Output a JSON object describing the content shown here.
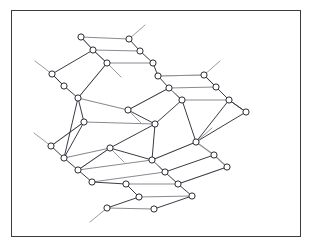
{
  "figure": {
    "title": "Hexagonal layered lattice perspective drawing",
    "kind": "line-drawing",
    "border_color": "#3a3a42",
    "background_color": "#ffffff",
    "node_fill": "#ffffff",
    "node_stroke": "#2b2b33",
    "bond_color_front": "#3b3b45",
    "bond_color_back": "#cfcfd4",
    "bond_color_mid": "#8a8a93",
    "stub_color": "#9a9aa3",
    "node_radius": 3.1,
    "node_count": 40,
    "ring_count": 3,
    "layer_count": 2
  },
  "chart_data": {
    "type": "scatter",
    "title": "Hexagonal layered lattice perspective drawing",
    "subtitle": "",
    "xlabel": "",
    "ylabel": "",
    "xlim": [
      11,
      301
    ],
    "ylim": [
      10,
      237
    ],
    "grid": false,
    "legend": "none",
    "axes_visible": false,
    "annotations": [],
    "layers": [
      {
        "name": "upper-layer",
        "stroke": "#3b3b45",
        "nodes": [
          {
            "id": "U1",
            "x": 81,
            "y": 37
          },
          {
            "id": "U2",
            "x": 129,
            "y": 39
          },
          {
            "id": "U3",
            "x": 93,
            "y": 50
          },
          {
            "id": "U4",
            "x": 140,
            "y": 51
          },
          {
            "id": "U5",
            "x": 107,
            "y": 63
          },
          {
            "id": "U6",
            "x": 153,
            "y": 63
          },
          {
            "id": "U7",
            "x": 52,
            "y": 74
          },
          {
            "id": "U8",
            "x": 64,
            "y": 86
          },
          {
            "id": "U9",
            "x": 158,
            "y": 76
          },
          {
            "id": "U10",
            "x": 204,
            "y": 75
          },
          {
            "id": "U11",
            "x": 78,
            "y": 98
          },
          {
            "id": "U12",
            "x": 169,
            "y": 88
          },
          {
            "id": "U13",
            "x": 216,
            "y": 87
          },
          {
            "id": "U14",
            "x": 128,
            "y": 110
          },
          {
            "id": "U15",
            "x": 182,
            "y": 100
          },
          {
            "id": "U16",
            "x": 229,
            "y": 100
          },
          {
            "id": "U17",
            "x": 84,
            "y": 122
          },
          {
            "id": "U18",
            "x": 155,
            "y": 124
          },
          {
            "id": "U19",
            "x": 246,
            "y": 112
          },
          {
            "id": "U20",
            "x": 51,
            "y": 146
          }
        ]
      },
      {
        "name": "lower-layer",
        "stroke": "#3b3b45",
        "nodes": [
          {
            "id": "L1",
            "x": 64,
            "y": 158
          },
          {
            "id": "L2",
            "x": 110,
            "y": 148
          },
          {
            "id": "L3",
            "x": 196,
            "y": 142
          },
          {
            "id": "L4",
            "x": 78,
            "y": 170
          },
          {
            "id": "L5",
            "x": 152,
            "y": 160
          },
          {
            "id": "L6",
            "x": 214,
            "y": 155
          },
          {
            "id": "L7",
            "x": 92,
            "y": 182
          },
          {
            "id": "L8",
            "x": 165,
            "y": 172
          },
          {
            "id": "L9",
            "x": 227,
            "y": 167
          },
          {
            "id": "L10",
            "x": 126,
            "y": 184
          },
          {
            "id": "L11",
            "x": 178,
            "y": 184
          },
          {
            "id": "L12",
            "x": 139,
            "y": 197
          },
          {
            "id": "L13",
            "x": 192,
            "y": 196
          },
          {
            "id": "L14",
            "x": 107,
            "y": 208
          },
          {
            "id": "L15",
            "x": 154,
            "y": 209
          }
        ]
      }
    ],
    "stubs": [
      {
        "from": "U2",
        "dx": 16,
        "dy": -14
      },
      {
        "from": "U5",
        "dx": 14,
        "dy": 14
      },
      {
        "from": "U7",
        "dx": -17,
        "dy": -13
      },
      {
        "from": "U10",
        "dx": 16,
        "dy": -14
      },
      {
        "from": "U12",
        "dx": 14,
        "dy": 14
      },
      {
        "from": "U14",
        "dx": 14,
        "dy": 14
      },
      {
        "from": "U20",
        "dx": -17,
        "dy": -13
      },
      {
        "from": "L2",
        "dx": 14,
        "dy": 14
      },
      {
        "from": "L5",
        "dx": 14,
        "dy": 14
      },
      {
        "from": "L14",
        "dx": -17,
        "dy": 14
      },
      {
        "from": "L3",
        "dx": 16,
        "dy": -14
      }
    ]
  }
}
